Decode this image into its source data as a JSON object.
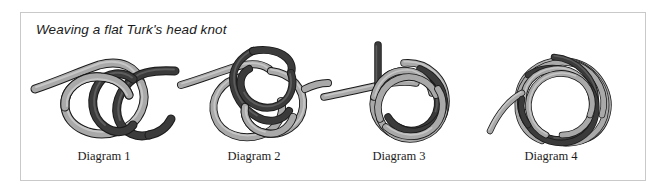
{
  "figure": {
    "title": "Weaving a flat Turk's head knot",
    "border_color": "#c9c9c9",
    "background_color": "#ffffff"
  },
  "rope": {
    "light_fill": "#a9a9a9",
    "light_highlight": "#c6c6c6",
    "dark_fill": "#3b3b3b",
    "dark_highlight": "#5c5c5c",
    "outline": "#1a1a1a"
  },
  "diagrams": [
    {
      "caption": "Diagram 1",
      "icon": "knot-step-1-icon",
      "description": "Light gray rope forms a single loop with its tail running to the upper left; a dark rope passes through the loop from the upper right."
    },
    {
      "caption": "Diagram 2",
      "icon": "knot-step-2-icon",
      "description": "The dark working end is woven over and under the gray loops, creating a three-loop interlaced cluster with a tail exiting to the right."
    },
    {
      "caption": "Diagram 3",
      "icon": "knot-step-3-icon",
      "description": "A vertical dark standing part crosses a horizontal gray strand at the left while the braid tightens into a rounder four-pass mat."
    },
    {
      "caption": "Diagram 4",
      "icon": "knot-step-4-icon",
      "description": "The finished flat Turk's head knot, fully doubled, with one loose working end curving out to the lower left."
    }
  ]
}
